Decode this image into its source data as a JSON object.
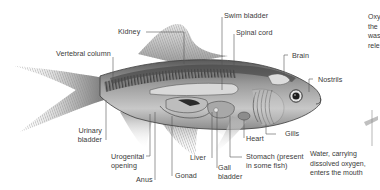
{
  "diagram": {
    "labels": {
      "kidney": "Kidney",
      "swim_bladder": "Swim bladder",
      "spinal_cord": "Spinal cord",
      "vertebral_column": "Vertebral column",
      "brain": "Brain",
      "nostrils": "Nostrils",
      "urinary_bladder_1": "Urinary",
      "urinary_bladder_2": "bladder",
      "urogenital_1": "Urogenital",
      "urogenital_2": "opening",
      "anus": "Anus",
      "gonad": "Gonad",
      "liver": "Liver",
      "gall_bladder_1": "Gall",
      "gall_bladder_2": "bladder",
      "heart": "Heart",
      "gills": "Gills",
      "stomach_1": "Stomach (present",
      "stomach_2": "in some fish)"
    },
    "side_panel": {
      "top_text": [
        "Oxy",
        "the",
        "was",
        "rele"
      ],
      "bottom_text": [
        "Water, carrying",
        "dissolved oxygen,",
        "enters the mouth"
      ]
    },
    "colors": {
      "background": "#ffffff",
      "label_text": "#3a3a3a",
      "leader_line": "#555555",
      "body_dark": "#4a4a4a",
      "body_mid": "#8a8a8a",
      "fin": "#b5b5b5"
    }
  }
}
